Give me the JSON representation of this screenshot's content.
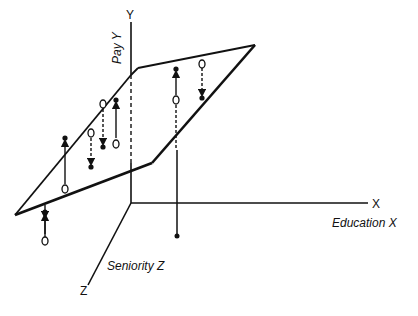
{
  "diagram": {
    "type": "3d-regression-plane",
    "axes": {
      "y": {
        "letter": "Y",
        "label": "Pay Y"
      },
      "x": {
        "letter": "X",
        "label": "Education X"
      },
      "z": {
        "letter": "Z",
        "label": "Seniority Z"
      }
    },
    "legend_symbols": {
      "observed": "filled-dot",
      "predicted": "open-circle",
      "positive_residual": "solid-arrow-up",
      "negative_residual": "dashed-arrow-down"
    },
    "points": [
      {
        "x": 65,
        "pred_y": 187,
        "obs_y": 138,
        "residual": "positive"
      },
      {
        "x": 45,
        "pred_y": 228,
        "obs_y": 212,
        "residual": "negative-below-plane"
      },
      {
        "x": 91,
        "pred_y": 133,
        "obs_y": 167,
        "residual": "negative"
      },
      {
        "x": 103,
        "pred_y": 104,
        "obs_y": 147,
        "residual": "negative"
      },
      {
        "x": 116,
        "pred_y": 143,
        "obs_y": 100,
        "residual": "positive"
      },
      {
        "x": 176,
        "pred_y": 100,
        "obs_y": 69,
        "residual": "positive"
      },
      {
        "x": 202,
        "pred_y": 63,
        "obs_y": 98,
        "residual": "negative"
      },
      {
        "x": 177,
        "pred_y": 150,
        "obs_y": 236,
        "residual": "negative-below"
      }
    ]
  }
}
